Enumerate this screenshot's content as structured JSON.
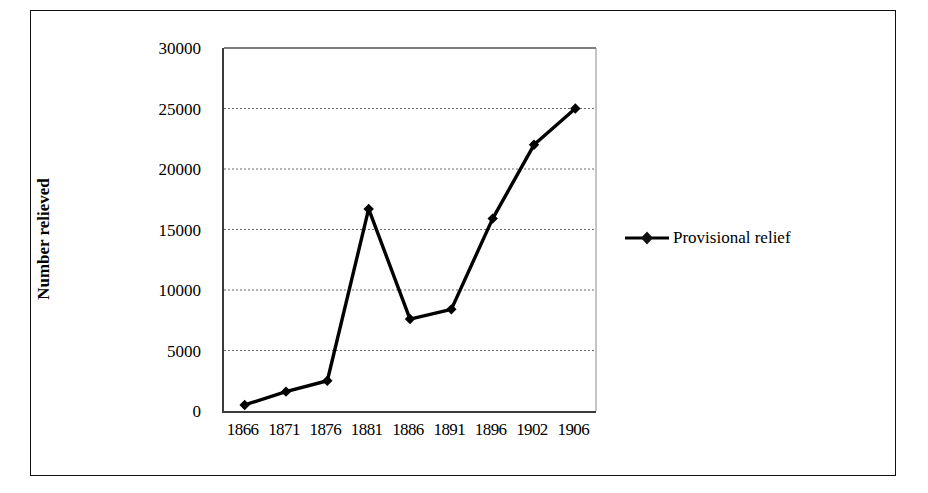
{
  "chart_data": {
    "type": "line",
    "title": "",
    "xlabel": "",
    "ylabel": "Number relieved",
    "categories": [
      "1866",
      "1871",
      "1876",
      "1881",
      "1886",
      "1891",
      "1896",
      "1902",
      "1906"
    ],
    "series": [
      {
        "name": "Provisional relief",
        "values": [
          500,
          1600,
          2500,
          16700,
          7600,
          8400,
          15900,
          22000,
          25000
        ],
        "color": "#000000",
        "marker": "diamond"
      }
    ],
    "ylim": [
      0,
      30000
    ],
    "yticks": [
      0,
      5000,
      10000,
      15000,
      20000,
      25000,
      30000
    ],
    "ytick_labels": [
      "0",
      "5000",
      "10000",
      "15000",
      "20000",
      "25000",
      "30000"
    ],
    "grid": "horizontal-dotted",
    "legend_position": "right"
  },
  "axes": {
    "y_title": "Number relieved"
  },
  "legend": {
    "entries": [
      {
        "label": "Provisional relief",
        "color": "#000000"
      }
    ]
  }
}
